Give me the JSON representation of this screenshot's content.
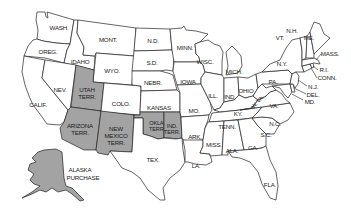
{
  "map": {
    "title": "United States territories map",
    "colors": {
      "state_fill": "#ffffff",
      "territory_fill": "#a3a3a3",
      "border": "#222222"
    },
    "labels": {
      "wash": "WASH.",
      "oreg": "OREG.",
      "calif": "CALIF.",
      "idaho": "IDAHO",
      "nev": "NEV.",
      "mont": "MONT.",
      "wyo": "WYO.",
      "utah1": "UTAH",
      "utah2": "TERR.",
      "colo": "COLO.",
      "ariz1": "ARIZONA",
      "ariz2": "TERR.",
      "nm1": "NEW",
      "nm2": "MEXICO",
      "nm3": "TERR.",
      "nd": "N.D.",
      "sd": "S.D.",
      "nebr": "NEBR.",
      "kansas": "KANSAS",
      "okla1": "OKLA.",
      "okla2": "TERR.",
      "ind1": "IND.",
      "ind2": "TERR.",
      "tex": "TEX.",
      "minn": "MINN.",
      "iowa": "IOWA",
      "mo": "MO.",
      "ark": "ARK.",
      "la": "LA.",
      "wisc": "WISC.",
      "ill": "ILL.",
      "mich": "MICH.",
      "indiana": "IND.",
      "ohio": "OHIO",
      "ky": "KY.",
      "tenn": "TENN.",
      "miss": "MISS.",
      "ala": "ALA.",
      "ga": "GA.",
      "fla": "FLA.",
      "sc": "S.C.",
      "nc": "N.C.",
      "va": "VA.",
      "wva": "W. VA.",
      "pa": "PA.",
      "ny": "N.Y.",
      "vt": "VT.",
      "nh": "N.H.",
      "me": "ME.",
      "mass": "MASS.",
      "ri": "R.I.",
      "conn": "CONN.",
      "nj": "N.J.",
      "del": "DEL.",
      "md": "MD.",
      "alaska1": "ALASKA",
      "alaska2": "PURCHASE"
    }
  }
}
